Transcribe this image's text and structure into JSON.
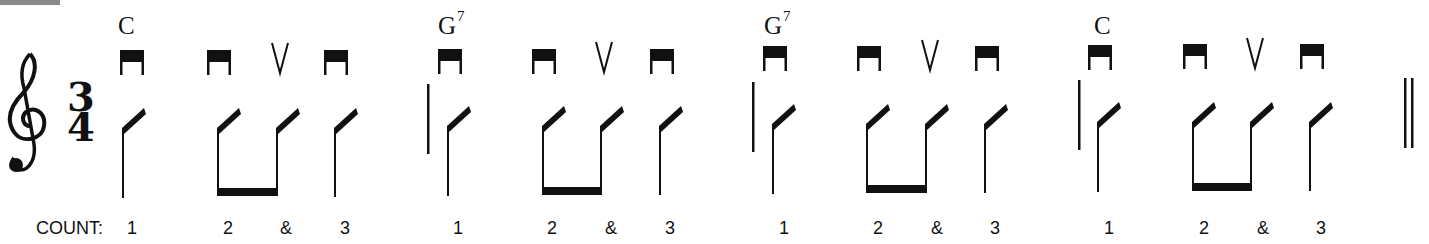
{
  "piece": {
    "time_signature": {
      "top": "3",
      "bottom": "4"
    },
    "clef": "treble-clef",
    "count_label": "COUNT:",
    "measures": [
      {
        "chord": {
          "root": "C",
          "ext": ""
        },
        "beats": [
          {
            "count": "1",
            "bowing": "down-bow"
          },
          {
            "count": "2",
            "bowing": "down-bow"
          },
          {
            "count": "&",
            "bowing": "up-bow"
          },
          {
            "count": "3",
            "bowing": "down-bow"
          }
        ]
      },
      {
        "chord": {
          "root": "G",
          "ext": "7"
        },
        "beats": [
          {
            "count": "1",
            "bowing": "down-bow"
          },
          {
            "count": "2",
            "bowing": "down-bow"
          },
          {
            "count": "&",
            "bowing": "up-bow"
          },
          {
            "count": "3",
            "bowing": "down-bow"
          }
        ]
      },
      {
        "chord": {
          "root": "G",
          "ext": "7"
        },
        "beats": [
          {
            "count": "1",
            "bowing": "down-bow"
          },
          {
            "count": "2",
            "bowing": "down-bow"
          },
          {
            "count": "&",
            "bowing": "up-bow"
          },
          {
            "count": "3",
            "bowing": "down-bow"
          }
        ]
      },
      {
        "chord": {
          "root": "C",
          "ext": ""
        },
        "beats": [
          {
            "count": "1",
            "bowing": "down-bow"
          },
          {
            "count": "2",
            "bowing": "down-bow"
          },
          {
            "count": "&",
            "bowing": "up-bow"
          },
          {
            "count": "3",
            "bowing": "down-bow"
          }
        ]
      }
    ],
    "ending": "double-barline"
  },
  "colors": {
    "ink": "#111111",
    "corner_bar": "#8a8a8a",
    "background": "#ffffff"
  }
}
